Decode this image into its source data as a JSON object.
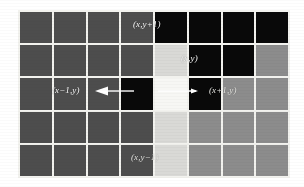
{
  "figure": {
    "background": "#ffffff",
    "grid": {
      "columns": 8,
      "rows": 5,
      "line_color": "#f2f2ee",
      "palette": {
        "dark_gray": "#4d4d4d",
        "medium_gray": "#8c8c8c",
        "light_gray": "#d9d9d6",
        "white": "#f7f7f4",
        "black": "#090909"
      },
      "cells": [
        [
          "dark",
          "dark",
          "dark",
          "dark",
          "black",
          "black",
          "black",
          "black"
        ],
        [
          "dark",
          "dark",
          "dark",
          "dark",
          "light",
          "black",
          "black",
          "med"
        ],
        [
          "dark",
          "dark",
          "dark",
          "black",
          "white",
          "black",
          "med",
          "med"
        ],
        [
          "dark",
          "dark",
          "dark",
          "dark",
          "light",
          "med",
          "med",
          "med"
        ],
        [
          "dark",
          "dark",
          "dark",
          "dark",
          "light",
          "med",
          "med",
          "med"
        ]
      ]
    },
    "labels": {
      "up": "(x,y+1)",
      "center": "(x,y)",
      "left": "(x−1,y)",
      "right": "(x+1,y)",
      "down": "(x,y−1)"
    },
    "arrows": {
      "left_arrow": "arrow pointing left",
      "right_arrow": "arrow pointing right"
    }
  }
}
